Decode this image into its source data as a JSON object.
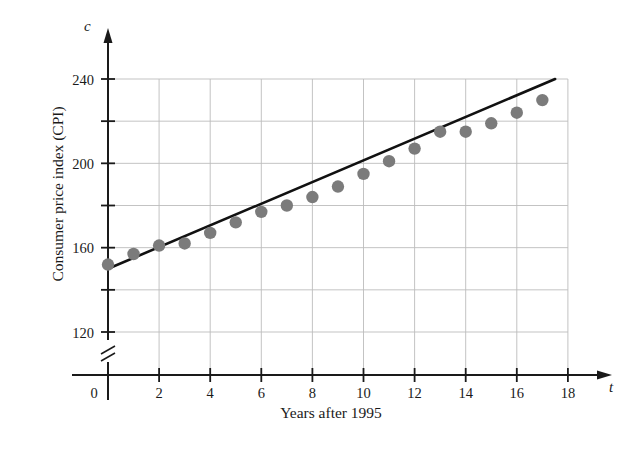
{
  "chart_data": {
    "type": "scatter",
    "title": "",
    "xlabel": "Years after 1995",
    "ylabel": "Consumer price index (CPI)",
    "x_axis_variable": "t",
    "y_axis_variable": "c",
    "xlim": [
      0,
      18.6
    ],
    "ylim": [
      112,
      252
    ],
    "y_axis_break": true,
    "y_axis_break_below": 120,
    "grid": true,
    "legend": null,
    "xticks": [
      0,
      2,
      4,
      6,
      8,
      10,
      12,
      14,
      16,
      18
    ],
    "xtick_labels": [
      "0",
      "2",
      "4",
      "6",
      "8",
      "10",
      "12",
      "14",
      "16",
      "18"
    ],
    "yticks": [
      120,
      140,
      160,
      180,
      200,
      220,
      240
    ],
    "ytick_labels": [
      "120",
      "",
      "160",
      "",
      "200",
      "",
      "240"
    ],
    "marker_color": "#7b7b7b",
    "line_color": "#111111",
    "grid_color": "#bcbcbc",
    "axis_color": "#1a1a1a",
    "x": [
      0,
      1,
      2,
      3,
      4,
      5,
      6,
      7,
      8,
      9,
      10,
      11,
      12,
      13,
      14,
      15,
      16,
      17
    ],
    "y": [
      152,
      157,
      161,
      162,
      167,
      172,
      177,
      180,
      184,
      189,
      195,
      201,
      207,
      215,
      215,
      219,
      224,
      230
    ],
    "series": [
      {
        "name": "Consumer price index (CPI)",
        "values": [
          152,
          157,
          161,
          162,
          167,
          172,
          177,
          180,
          184,
          189,
          195,
          201,
          207,
          215,
          215,
          219,
          224,
          230
        ]
      }
    ],
    "trend_line": {
      "type": "line",
      "x_start": 0,
      "y_start": 150,
      "x_end": 17.5,
      "y_end": 240,
      "slope": 5.14,
      "intercept": 150
    }
  }
}
